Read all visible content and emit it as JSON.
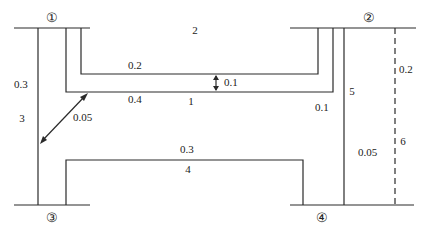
{
  "diagram": {
    "nodes": [
      {
        "id": "node-1",
        "label": "①",
        "x": 52,
        "y": 22
      },
      {
        "id": "node-2",
        "label": "②",
        "x": 369,
        "y": 22
      },
      {
        "id": "node-3",
        "label": "③",
        "x": 52,
        "y": 222
      },
      {
        "id": "node-4",
        "label": "④",
        "x": 322,
        "y": 222
      }
    ],
    "region_labels": [
      {
        "id": "region-1",
        "label": "1",
        "x": 191,
        "y": 105
      },
      {
        "id": "region-2",
        "label": "2",
        "x": 195,
        "y": 34
      },
      {
        "id": "region-3",
        "label": "3",
        "x": 22,
        "y": 122
      },
      {
        "id": "region-4",
        "label": "4",
        "x": 188,
        "y": 173
      },
      {
        "id": "region-5",
        "label": "5",
        "x": 352,
        "y": 95
      },
      {
        "id": "region-6",
        "label": "6",
        "x": 400,
        "y": 145
      }
    ],
    "value_labels": [
      {
        "id": "val-0-3-left",
        "label": "0.3",
        "x": 18,
        "y": 88
      },
      {
        "id": "val-0-2-top",
        "label": "0.2",
        "x": 133,
        "y": 69
      },
      {
        "id": "val-0-1-gap",
        "label": "0.1",
        "x": 228,
        "y": 86
      },
      {
        "id": "val-0-4",
        "label": "0.4",
        "x": 133,
        "y": 103
      },
      {
        "id": "val-0-05-left",
        "label": "0.05",
        "x": 73,
        "y": 121
      },
      {
        "id": "val-0-1-right",
        "label": "0.1",
        "x": 321,
        "y": 111
      },
      {
        "id": "val-0-2-right",
        "label": "0.2",
        "x": 400,
        "y": 73
      },
      {
        "id": "val-0-3-bottom",
        "label": "0.3",
        "x": 185,
        "y": 153
      },
      {
        "id": "val-0-05-right",
        "label": "0.05",
        "x": 363,
        "y": 156
      }
    ]
  }
}
